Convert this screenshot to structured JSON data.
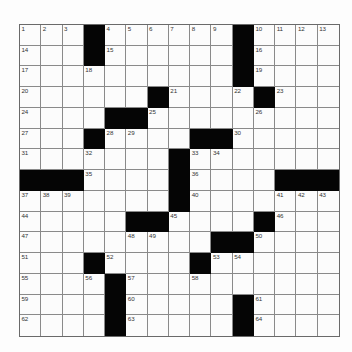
{
  "puzzle": {
    "rows": 15,
    "cols": 15,
    "grid": [
      [
        "1",
        "2",
        "3",
        "#",
        "4",
        "5",
        "6",
        "7",
        "8",
        "9",
        "#",
        "10",
        "11",
        "12",
        "13"
      ],
      [
        "14",
        "",
        "",
        "#",
        "15",
        "",
        "",
        "",
        "",
        "",
        "#",
        "16",
        "",
        "",
        ""
      ],
      [
        "17",
        "",
        "",
        "18",
        "",
        "",
        "",
        "",
        "",
        "",
        "#",
        "19",
        "",
        "",
        ""
      ],
      [
        "20",
        "",
        "",
        "",
        "",
        "",
        "#",
        "21",
        "",
        "",
        "22",
        "#",
        "23",
        "",
        ""
      ],
      [
        "24",
        "",
        "",
        "",
        "#",
        "#",
        "25",
        "",
        "",
        "",
        "",
        "26",
        "",
        "",
        ""
      ],
      [
        "27",
        "",
        "",
        "#",
        "28",
        "29",
        "",
        "",
        "#",
        "#",
        "30",
        "",
        "",
        "",
        ""
      ],
      [
        "31",
        "",
        "",
        "32",
        "",
        "",
        "",
        "#",
        "33",
        "34",
        "",
        "",
        "",
        "",
        ""
      ],
      [
        "#",
        "#",
        "#",
        "35",
        "",
        "",
        "",
        "#",
        "36",
        "",
        "",
        "",
        "#",
        "#",
        "#"
      ],
      [
        "37",
        "38",
        "39",
        "",
        "",
        "",
        "",
        "#",
        "40",
        "",
        "",
        "",
        "41",
        "42",
        "43"
      ],
      [
        "44",
        "",
        "",
        "",
        "",
        "#",
        "#",
        "45",
        "",
        "",
        "",
        "#",
        "46",
        "",
        ""
      ],
      [
        "47",
        "",
        "",
        "",
        "",
        "48",
        "49",
        "",
        "",
        "#",
        "#",
        "50",
        "",
        "",
        ""
      ],
      [
        "51",
        "",
        "",
        "#",
        "52",
        "",
        "",
        "",
        "#",
        "53",
        "54",
        "",
        "",
        "",
        ""
      ],
      [
        "55",
        "",
        "",
        "56",
        "#",
        "57",
        "",
        "",
        "58",
        "",
        "",
        "",
        "",
        "",
        ""
      ],
      [
        "59",
        "",
        "",
        "",
        "#",
        "60",
        "",
        "",
        "",
        "",
        "#",
        "61",
        "",
        "",
        ""
      ],
      [
        "62",
        "",
        "",
        "",
        "#",
        "63",
        "",
        "",
        "",
        "",
        "#",
        "64",
        "",
        "",
        ""
      ]
    ]
  },
  "colors": {
    "block": "#050505",
    "cell": "#fcfcfc",
    "gridline": "#8a8a8a"
  }
}
